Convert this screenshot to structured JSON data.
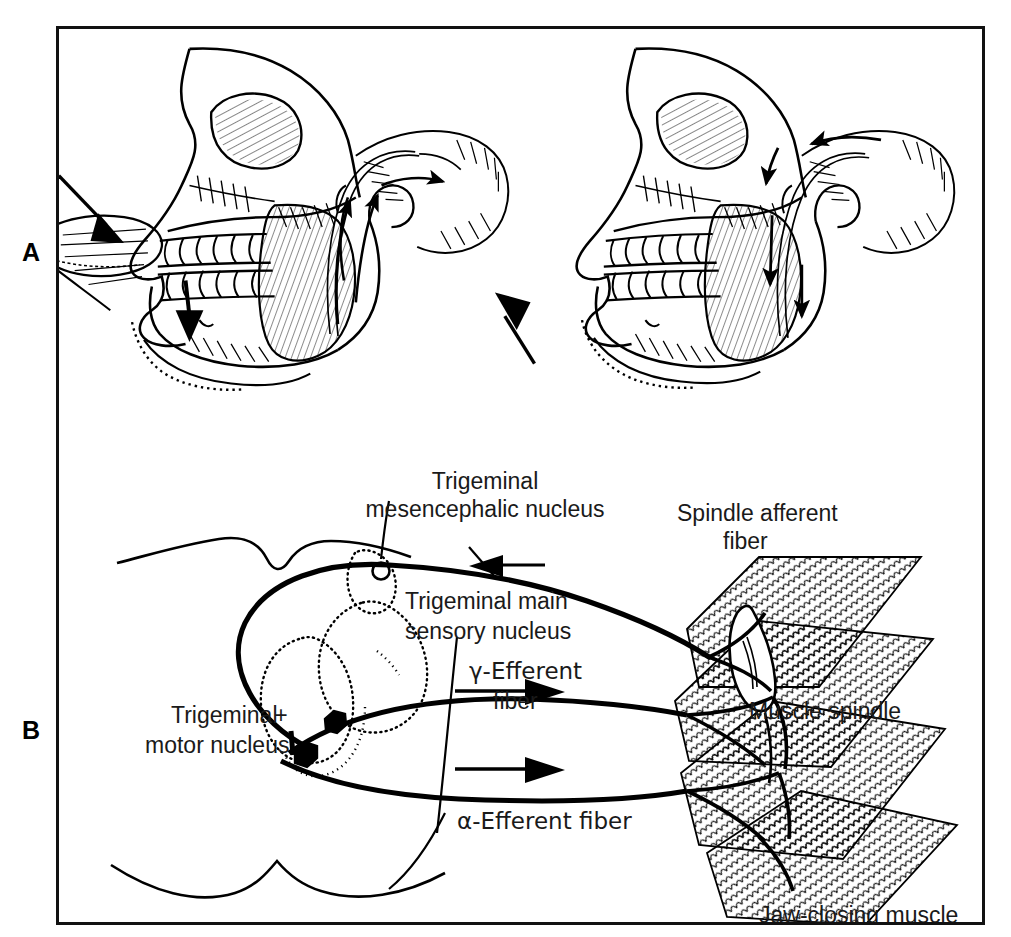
{
  "figure": {
    "border_color": "#111111",
    "ink_color": "#000000",
    "background": "#ffffff"
  },
  "panels": [
    {
      "letter": "A",
      "name": "jaw-reflex-skull-views",
      "subpanels": [
        {
          "name": "jaw-opening-stretch",
          "caption_none": "",
          "arrows": [
            {
              "name": "hammer-tap-arrow",
              "direction": "down-right"
            },
            {
              "name": "chin-depression-arrow",
              "direction": "down"
            }
          ]
        },
        {
          "name": "jaw-closing-response",
          "arrows": [
            {
              "name": "jaw-elevation-arrow",
              "direction": "up-left"
            },
            {
              "name": "efferent-arrow",
              "direction": "down"
            }
          ]
        }
      ]
    },
    {
      "letter": "B",
      "name": "reflex-arc-schematic"
    }
  ],
  "labels": {
    "mesencephalic_nucleus": "Trigeminal\nmesencephalic nucleus",
    "mesencephalic_nucleus_line1": "Trigeminal",
    "mesencephalic_nucleus_line2": "mesencephalic nucleus",
    "spindle_afferent_line1": "Spindle afferent",
    "spindle_afferent_line2": "fiber",
    "main_sensory_line1": "Trigeminal main",
    "main_sensory_line2": "sensory nucleus",
    "gamma_efferent_line1": "γ-Efferent",
    "gamma_efferent_line2": "fiber",
    "alpha_efferent": "α-Efferent fiber",
    "motor_nucleus_line1": "Trigeminal",
    "motor_nucleus_line2": "motor nucleus",
    "muscle_spindle": "Muscle spindle",
    "jaw_closing_muscle": "Jaw-closing muscle",
    "excitatory_sign": "+"
  }
}
